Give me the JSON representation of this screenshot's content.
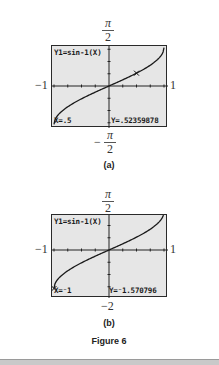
{
  "figure": {
    "caption": "Figure 6",
    "panels": [
      {
        "id": "a",
        "label": "(a)",
        "y_top_label": {
          "num": "π",
          "den": "2"
        },
        "y_bottom_label": {
          "sign": "−",
          "num": "π",
          "den": "2"
        },
        "x_left_label": "−1",
        "x_right_label": "1",
        "screen": {
          "equation": "Y1=sin-1(X)",
          "x_readout": "X=.5",
          "y_readout": "Y=.52359878",
          "cursor": {
            "x": 0.5,
            "y": 0.52359878
          }
        }
      },
      {
        "id": "b",
        "label": "(b)",
        "y_top_label": {
          "num": "π",
          "den": "2"
        },
        "y_bottom_label": {
          "text": "−2"
        },
        "x_left_label": "−1",
        "x_right_label": "1",
        "screen": {
          "equation": "Y1=sin-1(X)",
          "x_readout": "X=⁻1",
          "y_readout": "Y=⁻1.570796",
          "cursor": {
            "x": -1,
            "y": -1.570796
          }
        }
      }
    ]
  },
  "chart_data": [
    {
      "type": "line",
      "title": "Y1=sin-1(X)",
      "function": "arcsin(x)",
      "xlim": [
        -1,
        1
      ],
      "ylim": [
        -1.5708,
        1.5708
      ],
      "x": [
        -1,
        -0.9,
        -0.75,
        -0.5,
        -0.25,
        0,
        0.25,
        0.5,
        0.75,
        0.9,
        1
      ],
      "y": [
        -1.5708,
        -1.1198,
        -0.8481,
        -0.5236,
        -0.2527,
        0,
        0.2527,
        0.5236,
        0.8481,
        1.1198,
        1.5708
      ],
      "trace_point": {
        "x": 0.5,
        "y": 0.52359878
      },
      "axis_labels": {
        "x_min": "−1",
        "x_max": "1",
        "y_max": "π/2",
        "y_min": "−π/2"
      }
    },
    {
      "type": "line",
      "title": "Y1=sin-1(X)",
      "function": "arcsin(x)",
      "xlim": [
        -1,
        1
      ],
      "ylim": [
        -2,
        1.5708
      ],
      "x": [
        -1,
        -0.9,
        -0.75,
        -0.5,
        -0.25,
        0,
        0.25,
        0.5,
        0.75,
        0.9,
        1
      ],
      "y": [
        -1.5708,
        -1.1198,
        -0.8481,
        -0.5236,
        -0.2527,
        0,
        0.2527,
        0.5236,
        0.8481,
        1.1198,
        1.5708
      ],
      "trace_point": {
        "x": -1,
        "y": -1.570796
      },
      "axis_labels": {
        "x_min": "−1",
        "x_max": "1",
        "y_max": "π/2",
        "y_min": "−2"
      }
    }
  ]
}
